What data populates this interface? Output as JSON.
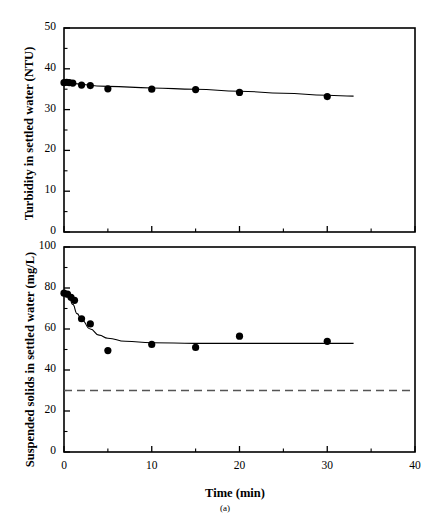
{
  "figure": {
    "caption": "(a)",
    "background_color": "#ffffff",
    "line_color": "#000000",
    "marker_color": "#000000",
    "reference_line_color": "#555555"
  },
  "xaxis": {
    "label": "Time (min)",
    "ticks": [
      0,
      10,
      20,
      30,
      40
    ],
    "minor_ticks": [
      5,
      15,
      25,
      35
    ],
    "min": 0,
    "max": 40
  },
  "chart_data": [
    {
      "type": "scatter",
      "panel": "top",
      "title": "",
      "xlabel": "Time (min)",
      "ylabel": "Turbidity in settled water (NTU)",
      "xlim": [
        0,
        40
      ],
      "ylim": [
        0,
        50
      ],
      "yticks": [
        0,
        10,
        20,
        30,
        40,
        50
      ],
      "yminor_ticks": [
        5,
        15,
        25,
        35,
        45
      ],
      "grid": false,
      "legend": "none",
      "series": [
        {
          "name": "Turbidity in settled water",
          "marker": "filled-circle",
          "x": [
            0.0,
            0.3,
            0.6,
            1.0,
            2.0,
            3.0,
            5.0,
            10.0,
            15.0,
            20.0,
            30.0
          ],
          "y": [
            36.6,
            36.7,
            36.6,
            36.5,
            36.0,
            35.9,
            35.1,
            35.0,
            34.9,
            34.2,
            33.2
          ]
        },
        {
          "name": "fitted trend line",
          "marker": "none",
          "x": [
            0.0,
            5.0,
            10.0,
            15.0,
            20.0,
            25.0,
            30.0,
            33.0
          ],
          "y": [
            36.5,
            35.7,
            35.3,
            35.0,
            34.5,
            34.0,
            33.5,
            33.3
          ]
        }
      ]
    },
    {
      "type": "scatter",
      "panel": "bottom",
      "title": "",
      "xlabel": "Time (min)",
      "ylabel": "Suspended solids in settled water (mg/L)",
      "xlim": [
        0,
        40
      ],
      "ylim": [
        0,
        100
      ],
      "yticks": [
        0,
        20,
        40,
        60,
        80,
        100
      ],
      "yminor_ticks": [
        10,
        30,
        50,
        70,
        90
      ],
      "grid": false,
      "legend": "none",
      "series": [
        {
          "name": "Suspended solids in settled water",
          "marker": "filled-circle",
          "x": [
            0.0,
            0.4,
            0.8,
            1.2,
            2.0,
            3.0,
            5.0,
            10.0,
            15.0,
            20.0,
            30.0
          ],
          "y": [
            77.5,
            77.0,
            75.5,
            74.0,
            65.0,
            62.5,
            49.5,
            52.5,
            51.0,
            56.5,
            54.0
          ]
        },
        {
          "name": "fitted decay curve",
          "marker": "none",
          "x": [
            0.5,
            1.0,
            1.5,
            2.0,
            3.0,
            4.0,
            5.0,
            7.0,
            10.0,
            15.0,
            20.0,
            25.0,
            30.0,
            33.0
          ],
          "y": [
            77.0,
            72.0,
            67.5,
            64.5,
            60.0,
            57.0,
            55.5,
            54.0,
            53.3,
            53.0,
            53.0,
            53.0,
            53.0,
            53.0
          ]
        },
        {
          "name": "regulatory reference level",
          "marker": "none",
          "style": "dashed",
          "x": [
            0,
            40
          ],
          "y": [
            30,
            30
          ]
        }
      ]
    }
  ]
}
